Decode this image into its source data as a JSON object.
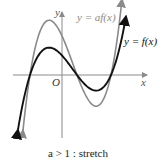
{
  "figure": {
    "axes": {
      "x_label": "x",
      "y_label": "y",
      "origin_label": "O"
    },
    "curves": [
      {
        "name": "f",
        "label": "y = f(x)",
        "color": "#111111",
        "scale": 1
      },
      {
        "name": "af",
        "label": "y = af(x)",
        "color": "#8a8a8a",
        "scale": 2
      }
    ],
    "caption": "a > 1 : stretch"
  }
}
